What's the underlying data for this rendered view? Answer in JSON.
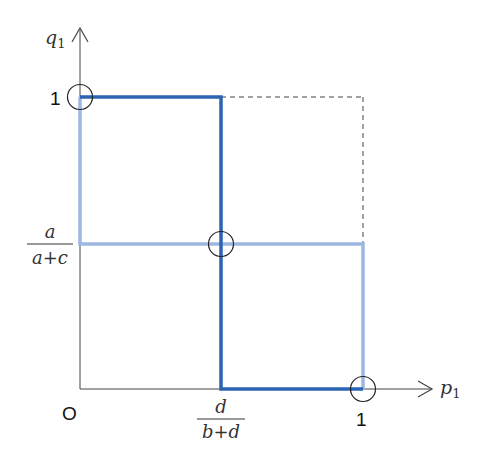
{
  "diagram": {
    "type": "best-response diagram (mixed strategy equilibria)",
    "axes": {
      "x_label": "p",
      "x_label_sub": "1",
      "y_label": "q",
      "y_label_sub": "1",
      "origin_label": "O",
      "x_tick_one": "1",
      "y_tick_one": "1",
      "x_tick_frac": {
        "num": "d",
        "den": "b+d"
      },
      "y_tick_frac": {
        "num": "a",
        "den": "a+c"
      }
    },
    "colors": {
      "player1_best_response": "#2c64b4",
      "player2_best_response": "#9cb8e0",
      "axis": "#444444",
      "dashed_box": "#444444",
      "equilibrium_marker": "#222222"
    },
    "equilibria": [
      {
        "label": "pure-equilibrium-top-left",
        "p": 0,
        "q": 1
      },
      {
        "label": "mixed-equilibrium",
        "p": "d/(b+d)",
        "q": "a/(a+c)"
      },
      {
        "label": "pure-equilibrium-bottom-right",
        "p": 1,
        "q": 0
      }
    ]
  }
}
